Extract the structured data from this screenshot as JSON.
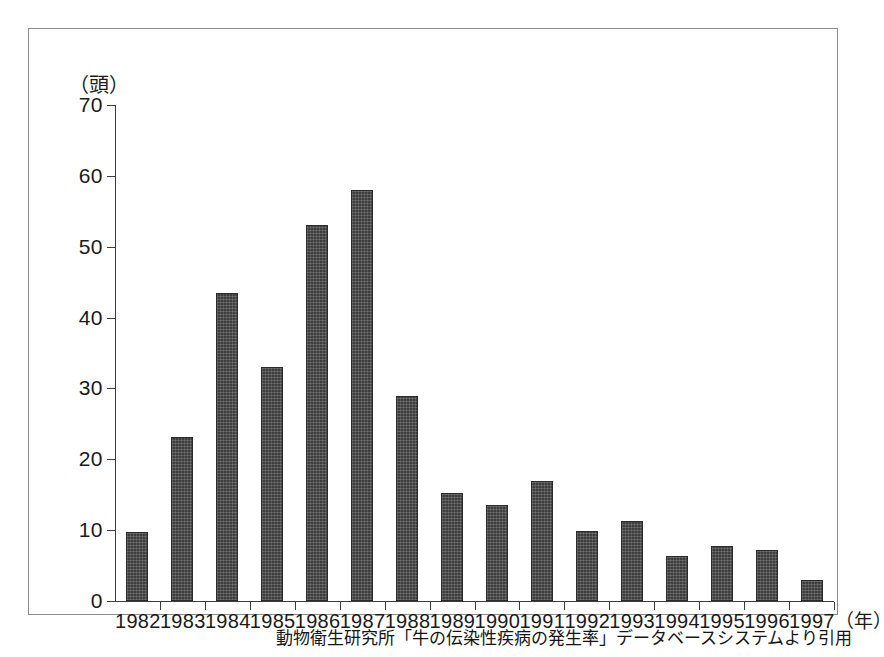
{
  "chart_data": {
    "type": "bar",
    "title": "",
    "subtitle": "",
    "xlabel": "（年）",
    "ylabel": "（頭）",
    "ylim": [
      0,
      70
    ],
    "yticks": [
      0,
      10,
      20,
      30,
      40,
      50,
      60,
      70
    ],
    "grid": false,
    "legend": null,
    "categories": [
      "1982",
      "1983",
      "1984",
      "1985",
      "1986",
      "1987",
      "1988",
      "1989",
      "1990",
      "1991",
      "1992",
      "1993",
      "1994",
      "1995",
      "1996",
      "1997"
    ],
    "values": [
      9.8,
      23.2,
      43.5,
      33.0,
      53.0,
      58.0,
      29.0,
      15.2,
      13.5,
      16.9,
      9.9,
      11.3,
      6.4,
      7.8,
      7.2,
      3.0
    ],
    "bar_color": "#3e3e3e",
    "axis_color": "#3c3c3c",
    "annotations": []
  },
  "axis": {
    "y_unit": "（頭）",
    "x_unit": "（年）",
    "tick_labels": [
      "70",
      "60",
      "50",
      "40",
      "30",
      "20",
      "10",
      "0"
    ]
  },
  "caption": {
    "text": "動物衛生研究所「牛の伝染性疾病の発生率」データベースシステムより引用"
  }
}
